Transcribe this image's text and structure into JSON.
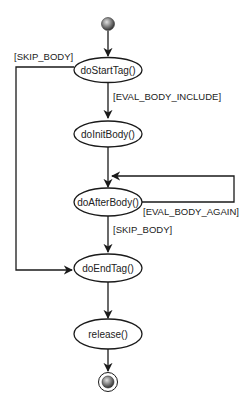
{
  "diagram": {
    "type": "uml-state-diagram",
    "colors": {
      "line": "#1a1a1a",
      "node_fill": "#ffffff",
      "start_fill_center": "#d8d8d8",
      "start_fill_edge": "#3a3a3a"
    },
    "states": [
      {
        "id": "doStartTag",
        "label": "doStartTag()"
      },
      {
        "id": "doInitBody",
        "label": "doInitBody()"
      },
      {
        "id": "doAfterBody",
        "label": "doAfterBody()"
      },
      {
        "id": "doEndTag",
        "label": "doEndTag()"
      },
      {
        "id": "release",
        "label": "release()"
      }
    ],
    "transitions": [
      {
        "from": "start",
        "to": "doStartTag",
        "guard": ""
      },
      {
        "from": "doStartTag",
        "to": "doEndTag",
        "guard": "[SKIP_BODY]"
      },
      {
        "from": "doStartTag",
        "to": "doInitBody",
        "guard": "[EVAL_BODY_INCLUDE]"
      },
      {
        "from": "doInitBody",
        "to": "doAfterBody",
        "guard": ""
      },
      {
        "from": "doAfterBody",
        "to": "doAfterBody",
        "guard": "[EVAL_BODY_AGAIN]"
      },
      {
        "from": "doAfterBody",
        "to": "doEndTag",
        "guard": "[SKIP_BODY]"
      },
      {
        "from": "doEndTag",
        "to": "release",
        "guard": ""
      },
      {
        "from": "release",
        "to": "end",
        "guard": ""
      }
    ]
  }
}
